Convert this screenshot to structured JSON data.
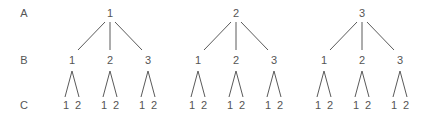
{
  "diagram": {
    "type": "tree",
    "levels": [
      {
        "label": "A",
        "y": 14
      },
      {
        "label": "B",
        "y": 61
      },
      {
        "label": "C",
        "y": 106
      }
    ],
    "colors": {
      "text": "#555555",
      "edge": "#5a5a5a",
      "background": "#ffffff"
    },
    "trees": [
      {
        "root": "1",
        "x": 110,
        "children": [
          {
            "label": "1",
            "x": 72,
            "leaves": [
              "1",
              "2"
            ]
          },
          {
            "label": "2",
            "x": 110,
            "leaves": [
              "1",
              "2"
            ]
          },
          {
            "label": "3",
            "x": 148,
            "leaves": [
              "1",
              "2"
            ]
          }
        ]
      },
      {
        "root": "2",
        "x": 236,
        "children": [
          {
            "label": "1",
            "x": 198,
            "leaves": [
              "1",
              "2"
            ]
          },
          {
            "label": "2",
            "x": 236,
            "leaves": [
              "1",
              "2"
            ]
          },
          {
            "label": "3",
            "x": 274,
            "leaves": [
              "1",
              "2"
            ]
          }
        ]
      },
      {
        "root": "3",
        "x": 362,
        "children": [
          {
            "label": "1",
            "x": 324,
            "leaves": [
              "1",
              "2"
            ]
          },
          {
            "label": "2",
            "x": 362,
            "leaves": [
              "1",
              "2"
            ]
          },
          {
            "label": "3",
            "x": 400,
            "leaves": [
              "1",
              "2"
            ]
          }
        ]
      }
    ]
  }
}
